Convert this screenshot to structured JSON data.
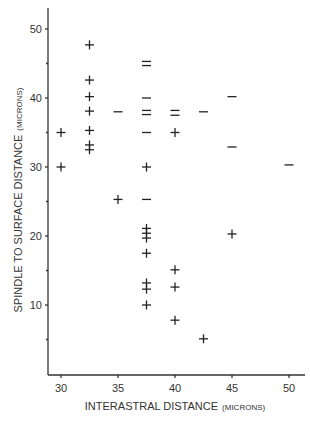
{
  "chart_data": {
    "type": "scatter",
    "title": "",
    "xlabel": "INTERASTRAL DISTANCE",
    "xlabel_unit": "(MICRONS)",
    "ylabel": "SPINDLE TO SURFACE DISTANCE",
    "ylabel_unit": "(MICRONS)",
    "xlim": [
      29,
      51
    ],
    "ylim": [
      0,
      53
    ],
    "x_ticks": [
      30,
      35,
      40,
      45,
      50
    ],
    "y_ticks": [
      10,
      20,
      30,
      40,
      50
    ],
    "y_minor_ticks": [
      5,
      15,
      25,
      35,
      45
    ],
    "grid": false,
    "legend": null,
    "marker_legend": {
      "plus": "+ marker",
      "dash": "– marker"
    },
    "series": [
      {
        "name": "plus",
        "marker": "+",
        "points": [
          [
            30,
            35
          ],
          [
            30,
            30
          ],
          [
            32.5,
            47.7
          ],
          [
            32.5,
            42.6
          ],
          [
            32.5,
            40.2
          ],
          [
            32.5,
            38.1
          ],
          [
            32.5,
            35.3
          ],
          [
            32.5,
            33.2
          ],
          [
            32.5,
            32.5
          ],
          [
            35,
            25.3
          ],
          [
            37.5,
            30
          ],
          [
            37.5,
            21.1
          ],
          [
            37.5,
            20.4
          ],
          [
            37.5,
            19.7
          ],
          [
            37.5,
            17.5
          ],
          [
            37.5,
            13.2
          ],
          [
            37.5,
            12.3
          ],
          [
            37.5,
            10
          ],
          [
            40,
            35
          ],
          [
            40,
            15.1
          ],
          [
            40,
            12.6
          ],
          [
            40,
            7.8
          ],
          [
            42.5,
            5.1
          ],
          [
            45,
            20.3
          ]
        ]
      },
      {
        "name": "dash",
        "marker": "–",
        "points": [
          [
            35,
            38
          ],
          [
            37.5,
            45.3
          ],
          [
            37.5,
            44.7
          ],
          [
            37.5,
            40
          ],
          [
            37.5,
            38.2
          ],
          [
            37.5,
            37.6
          ],
          [
            37.5,
            35
          ],
          [
            37.5,
            25.3
          ],
          [
            40,
            38.2
          ],
          [
            40,
            37.5
          ],
          [
            42.5,
            38
          ],
          [
            45,
            40.2
          ],
          [
            45,
            32.9
          ],
          [
            50,
            30.3
          ]
        ]
      }
    ]
  }
}
